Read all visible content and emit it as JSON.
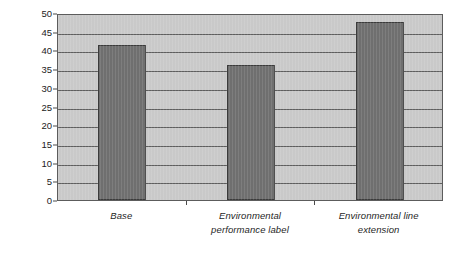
{
  "chart_data": {
    "type": "bar",
    "title": "",
    "subtitle": "",
    "xlabel": "",
    "ylabel": "% choice share",
    "categories": [
      "Base",
      "Environmental performance label",
      "Environmental line extension"
    ],
    "category_lines": [
      [
        "Base"
      ],
      [
        "Environmental",
        "performance label"
      ],
      [
        "Environmental line",
        "extension"
      ]
    ],
    "values": [
      41.5,
      36.0,
      47.5
    ],
    "ylim": [
      0,
      50
    ],
    "ytick_step": 5,
    "ytick_labels": [
      "50",
      "45",
      "40",
      "35",
      "30",
      "25",
      "20",
      "15",
      "10",
      "5",
      "0"
    ],
    "ytick_values": [
      50,
      45,
      40,
      35,
      30,
      25,
      20,
      15,
      10,
      5,
      0
    ],
    "grid": true,
    "grid_axis": "y",
    "legend": false,
    "legend_position": "none",
    "colors": {
      "bar_fill": "#6f6f6f",
      "bar_border": "#3b3b3b",
      "plot_background": "#c9c9c9",
      "plot_border": "#5c5c5c",
      "gridline": "#5e5e5e",
      "page_background": "#ffffff",
      "text": "#1f1f1f"
    }
  }
}
